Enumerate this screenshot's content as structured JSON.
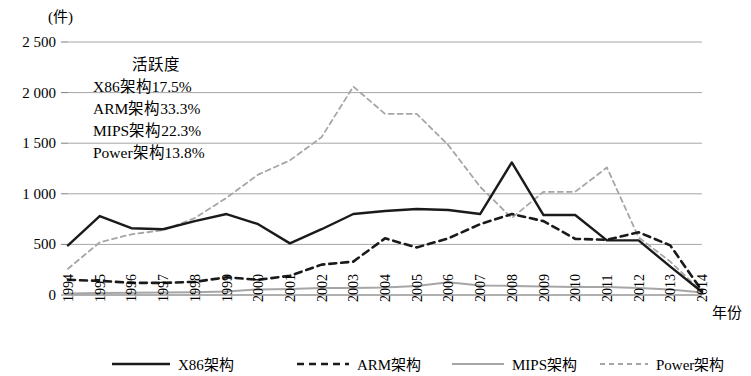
{
  "chart_data": {
    "type": "line",
    "title": "",
    "ylabel": "(件)",
    "xlabel": "年份",
    "ylim": [
      0,
      2500
    ],
    "yticks": [
      0,
      500,
      1000,
      1500,
      2000,
      2500
    ],
    "ytick_labels": [
      "0",
      "500",
      "1 000",
      "1 500",
      "2 000",
      "2 500"
    ],
    "grid": true,
    "legend_position": "bottom",
    "categories": [
      "1994",
      "1995",
      "1996",
      "1997",
      "1998",
      "1999",
      "2000",
      "2001",
      "2002",
      "2003",
      "2004",
      "2005",
      "2006",
      "2007",
      "2008",
      "2009",
      "2010",
      "2011",
      "2012",
      "2013",
      "2014"
    ],
    "series": [
      {
        "name": "X86架构",
        "style": "solid",
        "color": "#1a1a1a",
        "width": 2.4,
        "values": [
          490,
          780,
          660,
          650,
          730,
          800,
          700,
          510,
          650,
          800,
          830,
          850,
          840,
          800,
          1310,
          790,
          790,
          540,
          540,
          280,
          30
        ]
      },
      {
        "name": "ARM架构",
        "style": "dashed",
        "color": "#1a1a1a",
        "width": 2.6,
        "values": [
          150,
          140,
          120,
          120,
          130,
          175,
          150,
          190,
          300,
          330,
          560,
          470,
          560,
          700,
          800,
          730,
          555,
          545,
          620,
          490,
          40
        ]
      },
      {
        "name": "MIPS架构",
        "style": "solid",
        "color": "#a6a6a6",
        "width": 2.0,
        "values": [
          15,
          20,
          22,
          25,
          28,
          35,
          55,
          60,
          70,
          70,
          75,
          90,
          125,
          95,
          90,
          85,
          80,
          80,
          70,
          55,
          25
        ]
      },
      {
        "name": "Power架构",
        "style": "dashed",
        "color": "#a6a6a6",
        "width": 1.8,
        "values": [
          260,
          520,
          600,
          640,
          760,
          960,
          1190,
          1330,
          1560,
          2060,
          1790,
          1790,
          1480,
          1070,
          760,
          1020,
          1020,
          1260,
          570,
          330,
          30
        ]
      }
    ],
    "annotation": {
      "title": "活跃度",
      "lines": [
        "X86架构17.5%",
        "ARM架构33.3%",
        "MIPS架构22.3%",
        "Power架构13.8%"
      ]
    }
  }
}
